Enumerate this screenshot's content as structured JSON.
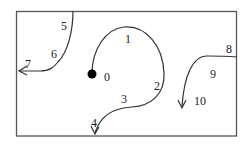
{
  "diagram": {
    "type": "trajectory-diagram",
    "colors": {
      "stroke": "#333333",
      "background": "#ffffff",
      "start_dot": "#000000"
    },
    "frame": {
      "x": 16,
      "y": 11,
      "width": 221,
      "height": 125
    },
    "labels": [
      {
        "id": "0",
        "text": "0",
        "x": 104,
        "y": 81
      },
      {
        "id": "1",
        "text": "1",
        "x": 126,
        "y": 43
      },
      {
        "id": "2",
        "text": "2",
        "x": 155,
        "y": 91
      },
      {
        "id": "3",
        "text": "3",
        "x": 122,
        "y": 104
      },
      {
        "id": "4",
        "text": "4",
        "x": 93,
        "y": 128
      },
      {
        "id": "5",
        "text": "5",
        "x": 62,
        "y": 30
      },
      {
        "id": "6",
        "text": "6",
        "x": 51,
        "y": 58
      },
      {
        "id": "7",
        "text": "7",
        "x": 25,
        "y": 68
      },
      {
        "id": "8",
        "text": "8",
        "x": 226,
        "y": 53
      },
      {
        "id": "9",
        "text": "9",
        "x": 210,
        "y": 78
      },
      {
        "id": "10",
        "text": "10",
        "x": 195,
        "y": 105
      }
    ],
    "paths": [
      {
        "id": "spiral",
        "description": "Starts at dot near label 0, arcs up through 1, around 2, down past 3, ending with arrow at 4"
      },
      {
        "id": "left-curve",
        "description": "From top border near 5, curves down through 6, arrow pointing left at 7"
      },
      {
        "id": "right-curve",
        "description": "From right border near 8, curves left past 9, arrow pointing down at 10"
      }
    ]
  }
}
